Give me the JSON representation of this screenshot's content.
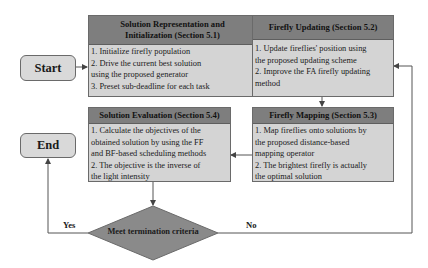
{
  "diagram": {
    "start": {
      "label": "Start"
    },
    "end": {
      "label": "End"
    },
    "boxes": {
      "init": {
        "title_line1": "Solution Representation and",
        "title_line2": "Initialization (Section 5.1)",
        "lines": [
          "1. Initialize firefly population",
          "2. Drive the current best solution",
          "using the proposed generator",
          "3. Preset sub-deadline for each task"
        ]
      },
      "update": {
        "title": "Firefly Updating (Section 5.2)",
        "lines": [
          "1. Update fireflies' position using",
          "the proposed updating scheme",
          "2. Improve the FA firefly updating",
          "method"
        ]
      },
      "mapping": {
        "title": "Firefly Mapping (Section 5.3)",
        "lines": [
          "1. Map fireflies onto solutions by",
          "the proposed distance-based",
          "mapping operator",
          "2. The brightest firefly is actually",
          "the optimal solution"
        ]
      },
      "evaluation": {
        "title": "Solution Evaluation (Section 5.4)",
        "lines": [
          "1. Calculate the objectives of the",
          "obtained solution by using the FF",
          "and BF-based scheduling methods",
          "2. The objective is the inverse of",
          "the  light intensity"
        ]
      }
    },
    "decision": {
      "label": "Meet termination criteria"
    },
    "edge_labels": {
      "yes": "Yes",
      "no": "No"
    },
    "colors": {
      "header_fill": "#7e7e7e",
      "body_fill": "#d4d4d4",
      "terminal_fill": "#d9d9d9",
      "diamond_fill": "#8a8a8a",
      "line": "#555555"
    }
  }
}
